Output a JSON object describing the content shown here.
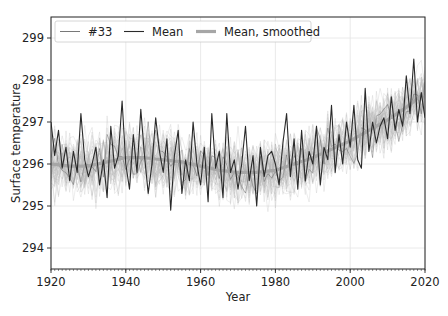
{
  "chart_data": {
    "type": "line",
    "title": "",
    "xlabel": "Year",
    "ylabel": "Surface temperature",
    "xlim": [
      1920,
      2020
    ],
    "ylim": [
      293.5,
      299.5
    ],
    "xticks": [
      1920,
      1940,
      1960,
      1980,
      2000,
      2020
    ],
    "yticks": [
      294,
      295,
      296,
      297,
      298,
      299
    ],
    "grid": true,
    "minor_xticks_every": 1,
    "legend": {
      "position": "upper-left",
      "ncol": 3,
      "entries": [
        {
          "label": "#33",
          "style": "thin-dark"
        },
        {
          "label": "Mean",
          "style": "dark"
        },
        {
          "label": "Mean, smoothed",
          "style": "thick-gray"
        }
      ]
    },
    "ensemble_background": {
      "description": "Many faint gray ensemble member traces surrounding the mean",
      "count": 40,
      "color": "#b0b0b0",
      "spread": 0.9
    },
    "series": [
      {
        "name": "Mean, smoothed",
        "color": "#a6a6a6",
        "width": 3.2,
        "x": [
          1920,
          1925,
          1930,
          1935,
          1940,
          1945,
          1950,
          1955,
          1960,
          1965,
          1970,
          1975,
          1980,
          1985,
          1990,
          1995,
          2000,
          2005,
          2010,
          2015,
          2020
        ],
        "values": [
          296.0,
          295.95,
          295.95,
          296.05,
          296.15,
          296.15,
          296.1,
          296.05,
          295.95,
          295.85,
          295.8,
          295.8,
          295.85,
          296.0,
          296.15,
          296.35,
          296.55,
          296.8,
          297.05,
          297.35,
          297.7
        ]
      },
      {
        "name": "Mean",
        "color": "#2a2a2a",
        "width": 1.1,
        "x_start": 1920,
        "x_step": 1,
        "values": [
          297.0,
          296.2,
          296.8,
          295.9,
          296.4,
          295.6,
          296.3,
          295.8,
          297.2,
          296.1,
          295.7,
          296.0,
          296.4,
          295.5,
          296.1,
          295.2,
          296.9,
          295.9,
          296.2,
          297.5,
          296.0,
          295.4,
          296.7,
          295.8,
          297.3,
          296.2,
          295.3,
          296.0,
          297.1,
          296.3,
          295.8,
          296.6,
          294.9,
          296.2,
          296.8,
          295.3,
          296.1,
          295.6,
          297.0,
          296.0,
          295.5,
          296.4,
          295.1,
          297.2,
          295.9,
          296.3,
          295.2,
          297.2,
          295.8,
          296.1,
          295.4,
          296.0,
          296.9,
          295.6,
          296.2,
          295.0,
          296.4,
          295.7,
          296.2,
          296.3,
          296.0,
          295.5,
          296.5,
          297.2,
          295.7,
          296.6,
          295.4,
          296.8,
          295.6,
          296.3,
          296.0,
          296.9,
          295.5,
          296.4,
          296.1,
          297.4,
          295.8,
          296.7,
          296.0,
          297.0,
          296.4,
          297.4,
          296.1,
          295.9,
          297.8,
          296.3,
          297.0,
          296.5,
          296.9,
          297.1,
          296.6,
          297.6,
          296.8,
          297.3,
          296.9,
          298.1,
          297.2,
          298.5,
          297.0,
          297.7,
          297.1
        ]
      },
      {
        "name": "#33",
        "color": "#555555",
        "width": 0.6,
        "x_start": 1920,
        "x_step": 1,
        "seed": 33,
        "amplitude": 0.75
      }
    ]
  }
}
